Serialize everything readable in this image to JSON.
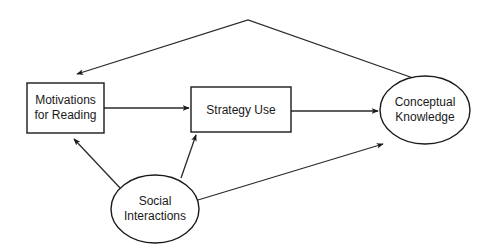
{
  "diagram": {
    "title": "",
    "nodes": [
      {
        "id": "motivations",
        "shape": "rectangle",
        "lines": [
          "Motivations",
          "for Reading"
        ]
      },
      {
        "id": "strategy",
        "shape": "rectangle",
        "lines": [
          "Strategy Use"
        ]
      },
      {
        "id": "conceptual",
        "shape": "ellipse",
        "lines": [
          "Conceptual",
          "Knowledge"
        ]
      },
      {
        "id": "social",
        "shape": "ellipse",
        "lines": [
          "Social",
          "Interactions"
        ]
      }
    ],
    "edges": [
      {
        "from": "motivations",
        "to": "strategy"
      },
      {
        "from": "strategy",
        "to": "conceptual"
      },
      {
        "from": "conceptual",
        "to": "motivations"
      },
      {
        "from": "social",
        "to": "motivations"
      },
      {
        "from": "social",
        "to": "strategy"
      },
      {
        "from": "social",
        "to": "conceptual"
      }
    ],
    "colors": {
      "stroke": "#1a1a1a",
      "background": "#ffffff"
    }
  }
}
